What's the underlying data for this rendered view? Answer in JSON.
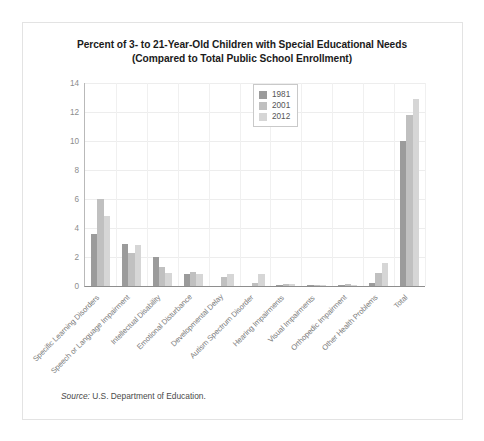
{
  "title_line1": "Percent of 3- to 21-Year-Old Children with Special Educational Needs",
  "title_line2": "(Compared to Total Public School Enrollment)",
  "source_label": "Source:",
  "source_text": "U.S. Department of Education.",
  "legend": {
    "items": [
      {
        "label": "1981",
        "color": "#9b9b9b"
      },
      {
        "label": "2001",
        "color": "#c0c0c0"
      },
      {
        "label": "2012",
        "color": "#d6d6d6"
      }
    ]
  },
  "chart_data": {
    "type": "bar",
    "title": "Percent of 3- to 21-Year-Old Children with Special Educational Needs (Compared to Total Public School Enrollment)",
    "xlabel": "",
    "ylabel": "",
    "ylim": [
      0,
      14
    ],
    "yticks": [
      0,
      2,
      4,
      6,
      8,
      10,
      12,
      14
    ],
    "grid": true,
    "legend_position": "top-center",
    "categories": [
      "Specific Learning Disorders",
      "Speech or Language Impairment",
      "Intellectual Disability",
      "Emotional Disturbance",
      "Developmental Delay",
      "Autism Spectrum Disorder",
      "Hearing Impairments",
      "Visual Impairments",
      "Orthopedic Impairment",
      "Other Health Problems",
      "Total"
    ],
    "series": [
      {
        "name": "1981",
        "color": "#9b9b9b",
        "values": [
          3.6,
          2.9,
          2.0,
          0.8,
          0,
          0,
          0.1,
          0.1,
          0.1,
          0.2,
          10.0
        ]
      },
      {
        "name": "2001",
        "color": "#c0c0c0",
        "values": [
          6.0,
          2.3,
          1.3,
          1.0,
          0.6,
          0.2,
          0.15,
          0.05,
          0.15,
          0.9,
          11.8
        ]
      },
      {
        "name": "2012",
        "color": "#d6d6d6",
        "values": [
          4.8,
          2.8,
          0.9,
          0.8,
          0.8,
          0.8,
          0.15,
          0.05,
          0.1,
          1.6,
          12.9
        ]
      }
    ]
  }
}
